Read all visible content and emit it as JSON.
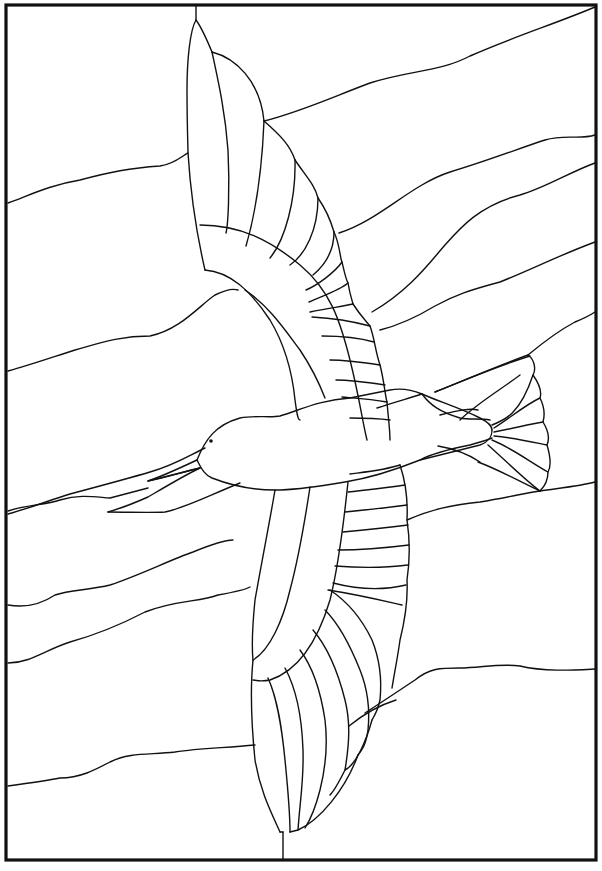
{
  "artwork": {
    "title": "Stained glass pattern: bird in flight",
    "subject": "bird-in-flight",
    "style": "line-art stained glass pattern",
    "colors": {
      "background": "#ffffff",
      "line": "#111111"
    },
    "elements": {
      "frame": "rectangular border",
      "background": "wavy horizontal sky bands",
      "bird": [
        "head",
        "beak",
        "eye",
        "body",
        "upper-wing",
        "lower-wing",
        "tail"
      ]
    }
  }
}
